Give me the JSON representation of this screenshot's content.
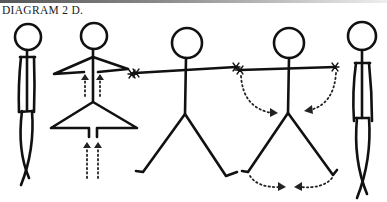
{
  "diagram": {
    "title": "DIAGRAM 2 D.",
    "figures": [
      {
        "id": "figure-1",
        "pose": "standing, arms at sides, legs crossed"
      },
      {
        "id": "figure-2",
        "pose": "arms bent at elbows, legs in triangle stance, upward arrows"
      },
      {
        "id": "figure-3",
        "pose": "arms extended horizontally, legs apart"
      },
      {
        "id": "figure-4",
        "pose": "arms extended, dotted arcs showing arms and legs moving inward"
      },
      {
        "id": "figure-5",
        "pose": "standing, arms at sides, legs crossed"
      }
    ],
    "colors": {
      "ink": "#111111",
      "background": "#ffffff"
    }
  }
}
